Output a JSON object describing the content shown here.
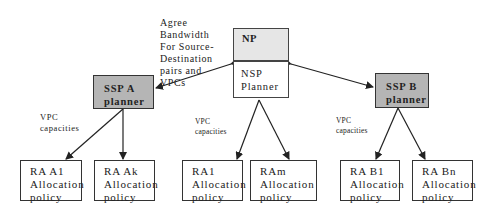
{
  "diagram": {
    "agreement_label": [
      "Agree",
      "Bandwidth",
      "For Source-",
      "Destination",
      "pairs and",
      "VPCs"
    ],
    "np_box": {
      "top_label": "NP",
      "bottom_label": [
        "NSP",
        "Planner"
      ]
    },
    "ssp_a": {
      "label": [
        "SSP A",
        "planner"
      ]
    },
    "ssp_b": {
      "label": [
        "SSP B",
        "planner"
      ]
    },
    "vpc_labels": [
      [
        "VPC",
        "capacities"
      ],
      [
        "VPC",
        "capacities"
      ],
      [
        "VPC",
        "capacities"
      ]
    ],
    "ra_boxes": [
      {
        "label": [
          "RA A1",
          "Allocation",
          "policy"
        ]
      },
      {
        "label": [
          "RA Ak",
          "Allocation",
          "policy"
        ]
      },
      {
        "label": [
          "RA1",
          "Allocation",
          "policy"
        ]
      },
      {
        "label": [
          "RAm",
          "Allocation",
          "policy"
        ]
      },
      {
        "label": [
          "RA B1",
          "Allocation",
          "policy"
        ]
      },
      {
        "label": [
          "RA Bn",
          "Allocation",
          "policy"
        ]
      }
    ],
    "colors": {
      "planner_fill": "#b5b5b5",
      "np_top_fill": "#e6e6e6",
      "stroke": "#333333"
    }
  }
}
